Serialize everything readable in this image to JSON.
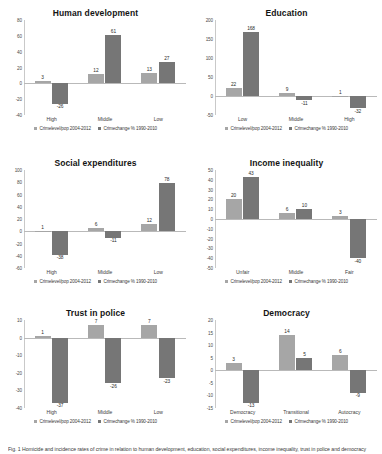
{
  "figure": {
    "caption": "Fig. 1 Homicide and incidence rates of crime in relation to human development, education, social expenditures, income inequality, trust in police and democracy 1990-2010"
  },
  "legend": {
    "series": [
      {
        "name": "Crimelevel/pop 2004-2012",
        "color": "#a6a6a6"
      },
      {
        "name": "Crimechange % 1990-2010",
        "color": "#767676"
      }
    ]
  },
  "chart_data": [
    {
      "type": "bar",
      "title": "Human development",
      "categories": [
        "High",
        "Middle",
        "Low"
      ],
      "series": [
        {
          "name": "Crimelevel/pop 2004-2012",
          "values": [
            3,
            12,
            13
          ]
        },
        {
          "name": "Crimechange % 1990-2010",
          "values": [
            -26,
            61,
            27
          ]
        }
      ],
      "xlabel": "",
      "ylabel": "",
      "ylim": [
        -40,
        80
      ],
      "yticks": [
        80,
        60,
        40,
        20,
        0,
        -20,
        -40
      ],
      "grid": false,
      "legend_position": "bottom"
    },
    {
      "type": "bar",
      "title": "Education",
      "categories": [
        "Low",
        "Middle",
        "High"
      ],
      "series": [
        {
          "name": "Crimelevel/pop 2004-2012",
          "values": [
            22,
            9,
            1
          ]
        },
        {
          "name": "Crimechange % 1990-2010",
          "values": [
            168,
            -11,
            -32
          ]
        }
      ],
      "xlabel": "",
      "ylabel": "",
      "ylim": [
        -50,
        200
      ],
      "yticks": [
        200,
        150,
        100,
        50,
        0,
        -50
      ],
      "grid": false,
      "legend_position": "bottom"
    },
    {
      "type": "bar",
      "title": "Social expenditures",
      "categories": [
        "High",
        "Middle",
        "Low"
      ],
      "series": [
        {
          "name": "Crimelevel/pop 2004-2012",
          "values": [
            1,
            6,
            12
          ]
        },
        {
          "name": "Crimechange % 1990-2010",
          "values": [
            -38,
            -11,
            78
          ]
        }
      ],
      "xlabel": "",
      "ylabel": "",
      "ylim": [
        -60,
        100
      ],
      "yticks": [
        100,
        80,
        60,
        40,
        20,
        0,
        -20,
        -40,
        -60
      ],
      "grid": false,
      "legend_position": "bottom"
    },
    {
      "type": "bar",
      "title": "Income inequality",
      "categories": [
        "Unfair",
        "Middle",
        "Fair"
      ],
      "series": [
        {
          "name": "Crimelevel/pop 2004-2012",
          "values": [
            20,
            6,
            3
          ]
        },
        {
          "name": "Crimechange % 1990-2010",
          "values": [
            43,
            10,
            -40
          ]
        }
      ],
      "xlabel": "",
      "ylabel": "",
      "ylim": [
        -50,
        50
      ],
      "yticks": [
        50,
        40,
        30,
        20,
        10,
        0,
        -10,
        -20,
        -30,
        -40,
        -50
      ],
      "grid": false,
      "legend_position": "bottom"
    },
    {
      "type": "bar",
      "title": "Trust in police",
      "categories": [
        "High",
        "Middle",
        "Low"
      ],
      "series": [
        {
          "name": "Crimelevel/pop 2004-2012",
          "values": [
            1,
            7,
            7
          ]
        },
        {
          "name": "Crimechange % 1990-2010",
          "values": [
            -37,
            -26,
            -23
          ]
        }
      ],
      "xlabel": "",
      "ylabel": "",
      "ylim": [
        -40,
        10
      ],
      "yticks": [
        10,
        0,
        -10,
        -20,
        -30,
        -40
      ],
      "grid": false,
      "legend_position": "bottom"
    },
    {
      "type": "bar",
      "title": "Democracy",
      "categories": [
        "Democracy",
        "Transitional",
        "Autocracy"
      ],
      "series": [
        {
          "name": "Crimelevel/pop 2004-2012",
          "values": [
            3,
            14,
            6
          ]
        },
        {
          "name": "Crimechange % 1990-2010",
          "values": [
            -13,
            5,
            -9
          ]
        }
      ],
      "xlabel": "",
      "ylabel": "",
      "ylim": [
        -15,
        20
      ],
      "yticks": [
        20,
        15,
        10,
        5,
        0,
        -5,
        -10,
        -15
      ],
      "grid": false,
      "legend_position": "bottom"
    }
  ]
}
